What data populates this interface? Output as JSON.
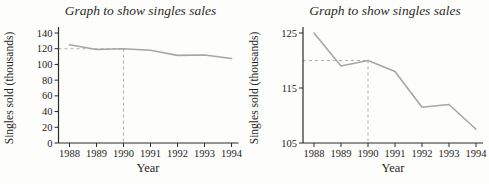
{
  "colors": {
    "background": "#fdfdfb",
    "line": "#a6a6a6",
    "dashed_guide": "#b0b0b0",
    "axis": "#2b2b2b",
    "text": "#1e1e1e"
  },
  "chart_data": [
    {
      "type": "line",
      "title": "Graph to show singles sales",
      "xlabel": "Year",
      "ylabel": "Singles sold (thousands)",
      "x": [
        1988,
        1989,
        1990,
        1991,
        1992,
        1993,
        1994
      ],
      "series": [
        {
          "name": "singles-sales",
          "values": [
            125,
            119,
            120,
            118,
            111.5,
            112,
            107.5
          ]
        }
      ],
      "ylim": [
        0,
        140
      ],
      "yticks": [
        0,
        20,
        40,
        60,
        80,
        100,
        120,
        140
      ],
      "grid": false,
      "annotation": {
        "x": 1990,
        "y": 120,
        "style": "dashed-guide"
      }
    },
    {
      "type": "line",
      "title": "Graph to show singles sales",
      "xlabel": "Year",
      "ylabel": "Singles sold (thousands)",
      "x": [
        1988,
        1989,
        1990,
        1991,
        1992,
        1993,
        1994
      ],
      "series": [
        {
          "name": "singles-sales",
          "values": [
            125,
            119,
            120,
            118,
            111.5,
            112,
            107.5
          ]
        }
      ],
      "ylim": [
        105,
        125
      ],
      "yticks": [
        105,
        115,
        125
      ],
      "grid": false,
      "annotation": {
        "x": 1990,
        "y": 120,
        "style": "dashed-guide"
      }
    }
  ]
}
